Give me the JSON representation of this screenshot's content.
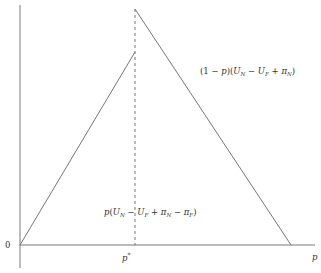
{
  "diagram": {
    "axes": {
      "origin_label": "0",
      "x_label": "p",
      "x_tick_label": "p*"
    },
    "annotations": {
      "right_segment": "(1 − p)(U_N − U_F + π_N)",
      "left_segment": "p(U_N − U_F + π_N − π_F)"
    },
    "geometry": {
      "origin": [
        20,
        245
      ],
      "x_axis_end": [
        315,
        245
      ],
      "y_axis_top": [
        20,
        5
      ],
      "y_axis_bottom": [
        20,
        268
      ],
      "p_star_x": 135,
      "left_line": [
        [
          20,
          245
        ],
        [
          135,
          52
        ]
      ],
      "right_line": [
        [
          135,
          9
        ],
        [
          291,
          245
        ]
      ],
      "dashed_line": [
        [
          135,
          9
        ],
        [
          135,
          245
        ]
      ]
    },
    "colors": {
      "line": "#777777",
      "text": "#333333",
      "background": "#ffffff"
    }
  }
}
